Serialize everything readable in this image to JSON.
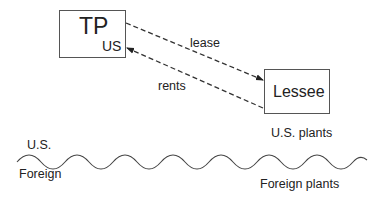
{
  "diagram": {
    "nodes": {
      "tp": {
        "label": "TP",
        "subscript": "US"
      },
      "lessee": {
        "label": "Lessee"
      }
    },
    "edges": {
      "lease": {
        "label": "lease",
        "from": "TP",
        "to": "Lessee",
        "style": "dashed"
      },
      "rents": {
        "label": "rents",
        "from": "Lessee",
        "to": "TP",
        "style": "dashed"
      }
    },
    "border": {
      "above_label": "U.S.",
      "below_label": "Foreign",
      "style": "wavy"
    },
    "annotations": {
      "us_plants": "U.S. plants",
      "foreign_plants": "Foreign plants"
    },
    "colors": {
      "stroke": "#333333",
      "box_border": "#555555",
      "text": "#222222"
    }
  }
}
